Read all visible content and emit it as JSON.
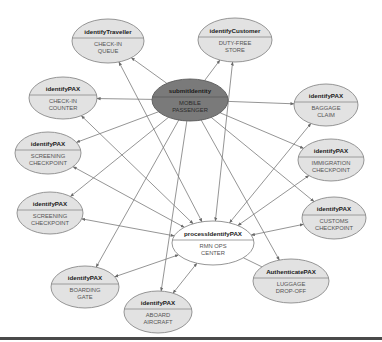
{
  "diagram": {
    "colors": {
      "node_fill": "#e2e2e2",
      "node_stroke": "#8a8a8a",
      "hub_fill": "#7a7a7a",
      "hub_stroke": "#5a5a5a",
      "edge": "#7a7a7a",
      "bottom_rule": "#4a4a4a"
    },
    "nodes": [
      {
        "id": "submit",
        "title": "submitIdentity",
        "subtitle": [
          "MOBILE",
          "PASSENGER"
        ],
        "cx": 190,
        "cy": 100,
        "rx": 38,
        "ry": 21,
        "style": "hub"
      },
      {
        "id": "process",
        "title": "processIdentifyPAX",
        "subtitle": [
          "RMN OPS",
          "CENTER"
        ],
        "cx": 213,
        "cy": 243,
        "rx": 41,
        "ry": 22,
        "style": "light"
      },
      {
        "id": "traveller",
        "title": "identifyTraveller",
        "subtitle": [
          "CHECK-IN",
          "QUEUE"
        ],
        "cx": 108,
        "cy": 41,
        "rx": 36,
        "ry": 22,
        "style": "node"
      },
      {
        "id": "customer",
        "title": "identifyCustomer",
        "subtitle": [
          "DUTY-FREE",
          "STORE"
        ],
        "cx": 235,
        "cy": 40,
        "rx": 37,
        "ry": 22,
        "style": "node"
      },
      {
        "id": "checkin",
        "title": "identifyPAX",
        "subtitle": [
          "CHECK-IN",
          "COUNTER"
        ],
        "cx": 63,
        "cy": 98,
        "rx": 34,
        "ry": 21,
        "style": "node"
      },
      {
        "id": "baggage",
        "title": "identifyPAX",
        "subtitle": [
          "BAGGAGE",
          "CLAIM"
        ],
        "cx": 326,
        "cy": 105,
        "rx": 32,
        "ry": 21,
        "style": "node"
      },
      {
        "id": "screening1",
        "title": "identifyPAX",
        "subtitle": [
          "SCREENING",
          "CHECKPOINT"
        ],
        "cx": 48,
        "cy": 153,
        "rx": 33,
        "ry": 21,
        "style": "node"
      },
      {
        "id": "immigration",
        "title": "identifyPAX",
        "subtitle": [
          "IMMIGRATION",
          "CHECKPOINT"
        ],
        "cx": 331,
        "cy": 160,
        "rx": 33,
        "ry": 21,
        "style": "node"
      },
      {
        "id": "screening2",
        "title": "identifyPAX",
        "subtitle": [
          "SCREENING",
          "CHECKPOINT"
        ],
        "cx": 50,
        "cy": 213,
        "rx": 33,
        "ry": 21,
        "style": "node"
      },
      {
        "id": "customs",
        "title": "identifyPAX",
        "subtitle": [
          "CUSTOMS",
          "CHECKPOINT"
        ],
        "cx": 334,
        "cy": 218,
        "rx": 32,
        "ry": 21,
        "style": "node"
      },
      {
        "id": "luggage",
        "title": "AuthenticatePAX",
        "subtitle": [
          "LUGGAGE",
          "DROP-OFF"
        ],
        "cx": 291,
        "cy": 281,
        "rx": 38,
        "ry": 22,
        "style": "node"
      },
      {
        "id": "boarding",
        "title": "identifyPAX",
        "subtitle": [
          "BOARDING",
          "GATE"
        ],
        "cx": 85,
        "cy": 287,
        "rx": 34,
        "ry": 21,
        "style": "node"
      },
      {
        "id": "aboard",
        "title": "identifyPAX",
        "subtitle": [
          "ABOARD",
          "AIRCRAFT"
        ],
        "cx": 158,
        "cy": 312,
        "rx": 34,
        "ry": 21,
        "style": "node"
      }
    ],
    "edges": [
      {
        "from": "submit",
        "to": "traveller",
        "type": "arrow"
      },
      {
        "from": "submit",
        "to": "customer",
        "type": "arrow"
      },
      {
        "from": "submit",
        "to": "checkin",
        "type": "arrow"
      },
      {
        "from": "submit",
        "to": "baggage",
        "type": "arrow"
      },
      {
        "from": "submit",
        "to": "screening1",
        "type": "arrow"
      },
      {
        "from": "submit",
        "to": "immigration",
        "type": "arrow"
      },
      {
        "from": "submit",
        "to": "screening2",
        "type": "arrow"
      },
      {
        "from": "submit",
        "to": "customs",
        "type": "arrow"
      },
      {
        "from": "submit",
        "to": "luggage",
        "type": "arrow"
      },
      {
        "from": "submit",
        "to": "boarding",
        "type": "arrow"
      },
      {
        "from": "submit",
        "to": "aboard",
        "type": "arrow"
      },
      {
        "from": "process",
        "to": "traveller",
        "type": "double"
      },
      {
        "from": "process",
        "to": "customer",
        "type": "double"
      },
      {
        "from": "process",
        "to": "checkin",
        "type": "double"
      },
      {
        "from": "process",
        "to": "baggage",
        "type": "double"
      },
      {
        "from": "process",
        "to": "screening1",
        "type": "double"
      },
      {
        "from": "process",
        "to": "immigration",
        "type": "double"
      },
      {
        "from": "process",
        "to": "screening2",
        "type": "double"
      },
      {
        "from": "process",
        "to": "customs",
        "type": "double"
      },
      {
        "from": "process",
        "to": "luggage",
        "type": "line"
      },
      {
        "from": "process",
        "to": "boarding",
        "type": "double"
      },
      {
        "from": "process",
        "to": "aboard",
        "type": "double"
      }
    ]
  }
}
